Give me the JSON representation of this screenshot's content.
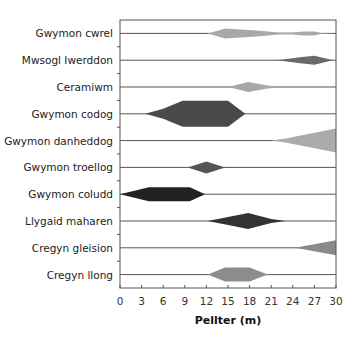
{
  "chart_data": {
    "type": "kite-diagram",
    "title": "",
    "xlabel": "Pellter (m)",
    "ylabel": "",
    "xlim": [
      0,
      30
    ],
    "xticks": [
      0,
      3,
      6,
      9,
      12,
      15,
      18,
      21,
      24,
      27,
      30
    ],
    "grid": false,
    "legend": null,
    "series": [
      {
        "name": "Gwymon cwrel",
        "color": "#a8a8a8",
        "profile": [
          [
            12.2,
            0
          ],
          [
            14.6,
            5
          ],
          [
            19,
            3
          ],
          [
            22,
            1
          ],
          [
            24,
            1
          ],
          [
            25.5,
            2
          ],
          [
            27,
            2
          ],
          [
            28,
            0.3
          ],
          [
            30,
            0
          ]
        ]
      },
      {
        "name": "Mwsogl Iwerddon",
        "color": "#6a6a6a",
        "profile": [
          [
            21.8,
            0
          ],
          [
            25,
            3
          ],
          [
            27,
            4.5
          ],
          [
            29.6,
            0
          ]
        ]
      },
      {
        "name": "Ceramiwm",
        "color": "#a8a8a8",
        "profile": [
          [
            15,
            0
          ],
          [
            17.8,
            5
          ],
          [
            20.5,
            1.5
          ],
          [
            23,
            0
          ]
        ]
      },
      {
        "name": "Gwymon codog",
        "color": "#4a4a4a",
        "profile": [
          [
            3.5,
            0
          ],
          [
            6,
            5
          ],
          [
            8.7,
            13
          ],
          [
            15,
            13
          ],
          [
            17.4,
            0
          ]
        ]
      },
      {
        "name": "Gwymon danheddog",
        "color": "#ababab",
        "profile": [
          [
            21,
            0
          ],
          [
            23,
            2
          ],
          [
            30,
            12
          ]
        ]
      },
      {
        "name": "Gwymon troellog",
        "color": "#555555",
        "profile": [
          [
            9.4,
            0
          ],
          [
            12,
            6
          ],
          [
            14.6,
            0
          ]
        ]
      },
      {
        "name": "Gwymon coludd",
        "color": "#222222",
        "profile": [
          [
            0,
            0
          ],
          [
            4,
            7
          ],
          [
            9.7,
            7
          ],
          [
            11.8,
            0
          ]
        ]
      },
      {
        "name": "Llygaid maharen",
        "color": "#333333",
        "profile": [
          [
            12.2,
            0
          ],
          [
            17.8,
            8
          ],
          [
            21,
            2
          ],
          [
            23,
            0
          ]
        ]
      },
      {
        "name": "Cregyn gleision",
        "color": "#8a8a8a",
        "profile": [
          [
            24.3,
            0
          ],
          [
            30,
            7.5
          ]
        ]
      },
      {
        "name": "Cregyn llong",
        "color": "#8c8c8c",
        "profile": [
          [
            12.2,
            0
          ],
          [
            14.6,
            7
          ],
          [
            18,
            7
          ],
          [
            20.5,
            0
          ]
        ]
      }
    ]
  }
}
